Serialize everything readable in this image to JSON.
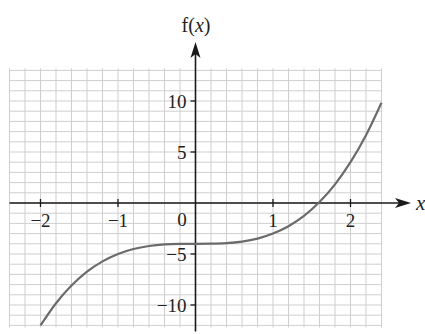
{
  "chart_data": {
    "type": "line",
    "title": "",
    "xlabel": "x",
    "ylabel": "f(x)",
    "function": "f(x) = x^3 - 4",
    "xlim": [
      -2.4,
      2.4
    ],
    "ylim": [
      -12.2,
      13.2
    ],
    "x_ticks": [
      -2,
      -1,
      1,
      2
    ],
    "x_tick_labels": [
      "−2",
      "−1",
      "1",
      "2"
    ],
    "y_ticks": [
      10,
      5,
      -5,
      -10
    ],
    "y_tick_labels": [
      "10",
      "5",
      "−5",
      "−10"
    ],
    "origin_label": "0",
    "grid": true,
    "grid_minor_x": 0.2,
    "grid_minor_y": 1,
    "series": [
      {
        "name": "f(x)",
        "x": [
          -2.0,
          -1.8,
          -1.6,
          -1.4,
          -1.2,
          -1.0,
          -0.8,
          -0.6,
          -0.4,
          -0.2,
          0.0,
          0.2,
          0.4,
          0.6,
          0.8,
          1.0,
          1.2,
          1.4,
          1.6,
          1.8,
          2.0,
          2.2,
          2.4
        ],
        "values": [
          -12.0,
          -9.83,
          -8.1,
          -6.74,
          -5.73,
          -5.0,
          -4.51,
          -4.22,
          -4.06,
          -4.01,
          -4.0,
          -3.99,
          -3.94,
          -3.78,
          -3.49,
          -3.0,
          -2.27,
          -1.26,
          0.1,
          1.83,
          4.0,
          6.65,
          9.82
        ]
      }
    ],
    "colors": {
      "curve": "#6b6b6b",
      "axis": "#1a1a1a",
      "grid": "#cfcfcf",
      "text": "#222222"
    }
  }
}
